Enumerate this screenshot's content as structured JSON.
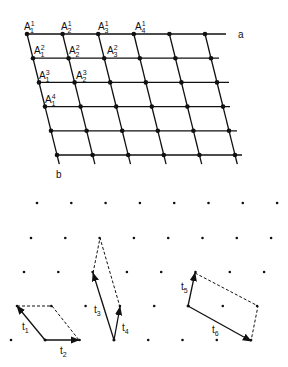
{
  "colors": {
    "ink": "#111111",
    "background": "#ffffff"
  },
  "grid": {
    "axis_a_label": "a",
    "axis_b_label": "b",
    "rows": 6,
    "cols": 6,
    "origin": [
      27,
      34
    ],
    "col_step": [
      35.6,
      0
    ],
    "row_step": [
      6,
      24.2
    ],
    "row_line_ends": [
      226,
      219,
      229,
      230,
      237,
      242
    ],
    "labels": [
      {
        "base": "A",
        "sub": "1",
        "sup": "1",
        "x": 24,
        "y": 30
      },
      {
        "base": "A",
        "sub": "2",
        "sup": "1",
        "x": 61,
        "y": 30
      },
      {
        "base": "A",
        "sub": "3",
        "sup": "1",
        "x": 98,
        "y": 30
      },
      {
        "base": "A",
        "sub": "4",
        "sup": "1",
        "x": 135,
        "y": 30
      },
      {
        "base": "A",
        "sub": "1",
        "sup": "2",
        "x": 34,
        "y": 54
      },
      {
        "base": "A",
        "sub": "2",
        "sup": "2",
        "x": 69,
        "y": 54
      },
      {
        "base": "A",
        "sub": "3",
        "sup": "2",
        "x": 107,
        "y": 54
      },
      {
        "base": "A",
        "sub": "1",
        "sup": "3",
        "x": 39,
        "y": 79
      },
      {
        "base": "A",
        "sub": "2",
        "sup": "3",
        "x": 76,
        "y": 79
      },
      {
        "base": "A",
        "sub": "1",
        "sup": "4",
        "x": 45,
        "y": 103
      }
    ]
  },
  "lattice": {
    "rows": [
      {
        "y": 203,
        "x0": 37
      },
      {
        "y": 238,
        "x0": 31
      },
      {
        "y": 272,
        "x0": 24
      },
      {
        "y": 306,
        "x0": 17
      },
      {
        "y": 340,
        "x0": 11
      }
    ],
    "count": 8,
    "step": 34.3
  },
  "cells": [
    {
      "vectors": [
        {
          "label": "t",
          "sub": "1",
          "from": [
            45,
            340
          ],
          "to": [
            17,
            306
          ],
          "lx": 22,
          "ly": 330
        },
        {
          "label": "t",
          "sub": "2",
          "from": [
            45,
            340
          ],
          "to": [
            79,
            340
          ],
          "lx": 60,
          "ly": 354
        }
      ],
      "dashed": [
        [
          17,
          306
        ],
        [
          52,
          306
        ],
        [
          79,
          340
        ]
      ]
    },
    {
      "vectors": [
        {
          "label": "t",
          "sub": "3",
          "from": [
            114,
            340
          ],
          "to": [
            93,
            273
          ],
          "lx": 94,
          "ly": 313
        },
        {
          "label": "t",
          "sub": "4",
          "from": [
            114,
            340
          ],
          "to": [
            120,
            307
          ],
          "lx": 122,
          "ly": 331
        }
      ],
      "dashed": [
        [
          93,
          273
        ],
        [
          100,
          238
        ],
        [
          120,
          307
        ]
      ]
    },
    {
      "vectors": [
        {
          "label": "t",
          "sub": "5",
          "from": [
            188,
            306
          ],
          "to": [
            195,
            273
          ],
          "lx": 181,
          "ly": 290
        },
        {
          "label": "t",
          "sub": "6",
          "from": [
            188,
            306
          ],
          "to": [
            251,
            341
          ],
          "lx": 212,
          "ly": 333
        }
      ],
      "dashed": [
        [
          195,
          273
        ],
        [
          258,
          306
        ],
        [
          251,
          341
        ]
      ]
    }
  ]
}
